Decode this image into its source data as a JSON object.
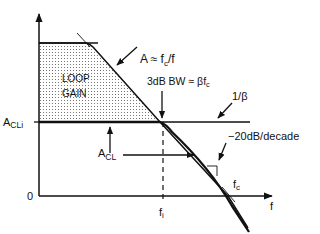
{
  "diagram": {
    "title": "",
    "labels": {
      "open_loop_gain": "A ≈ f",
      "open_loop_gain_sub": "c",
      "open_loop_gain_tail": "/f",
      "loop_gain_line1": "LOOP",
      "loop_gain_line2": "GAIN",
      "bw_3db": "3dB  BW ≈ βf",
      "bw_3db_sub": "c",
      "inv_beta": "1/β",
      "acli": "A",
      "acli_sub": "CLi",
      "acl": "A",
      "acl_sub": "CL",
      "rolloff": "−20dB/decade",
      "fc": "f",
      "fc_sub": "c",
      "fi": "f",
      "fi_sub": "i",
      "f_axis": "f",
      "zero": "0"
    },
    "colors": {
      "ink": "#111111",
      "dots": "#666666",
      "background": "#ffffff"
    }
  }
}
